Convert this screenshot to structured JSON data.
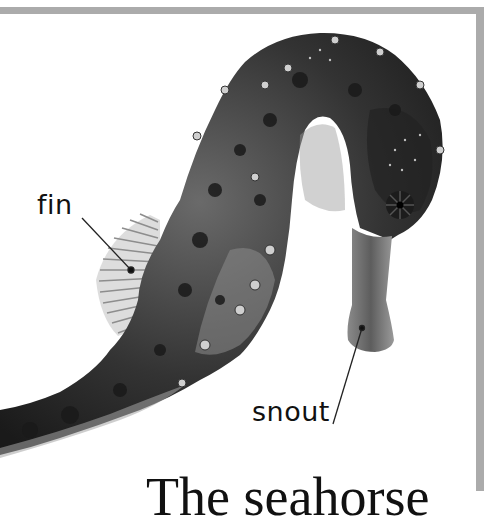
{
  "page": {
    "frame_color": "#ababab",
    "background": "#ffffff"
  },
  "figure": {
    "labels": {
      "fin": "fin",
      "snout": "snout"
    }
  },
  "caption": {
    "text": "The seahorse"
  }
}
